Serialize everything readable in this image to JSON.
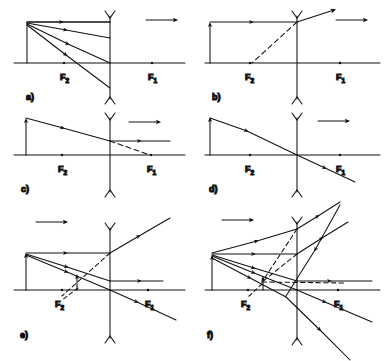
{
  "figure": {
    "background_color": "#ffffff",
    "line_color": "#111111",
    "panel_count": 6,
    "lens_type": "diverging-concave",
    "focal_labels": {
      "left": "F",
      "left_sub": "2",
      "right": "F",
      "right_sub": "1"
    }
  },
  "panels": [
    {
      "id": "a",
      "label": "a)",
      "direction_arrow": "right",
      "description": "Fan of rays from object tip converging toward lens and beyond",
      "has_object_arrow": true,
      "has_dashed_ray": false,
      "ray_count": 4,
      "focal_left": "F",
      "focal_left_sub": "2",
      "focal_right": "F",
      "focal_right_sub": "1"
    },
    {
      "id": "b",
      "label": "b)",
      "direction_arrow": "right",
      "description": "Parallel ray refracted upward, dashed backward extension through F2",
      "has_object_arrow": true,
      "has_dashed_ray": true,
      "ray_count": 2,
      "focal_left": "F",
      "focal_left_sub": "2",
      "focal_right": "F",
      "focal_right_sub": "1"
    },
    {
      "id": "c",
      "label": "c)",
      "direction_arrow": "right",
      "description": "Ray toward F1 emerges parallel to axis, dashed continuation to F1",
      "has_object_arrow": true,
      "has_dashed_ray": true,
      "ray_count": 2,
      "focal_left": "F",
      "focal_left_sub": "2",
      "focal_right": "F",
      "focal_right_sub": "1"
    },
    {
      "id": "d",
      "label": "d)",
      "direction_arrow": "right",
      "description": "Ray through lens centre passes undeviated",
      "has_object_arrow": true,
      "has_dashed_ray": false,
      "ray_count": 1,
      "focal_left": "F",
      "focal_left_sub": "2",
      "focal_right": "F",
      "focal_right_sub": "1"
    },
    {
      "id": "e",
      "label": "e)",
      "direction_arrow": "right",
      "description": "Two principal rays locate reduced virtual image near F2",
      "has_object_arrow": true,
      "has_image_arrow": true,
      "has_dashed_ray": true,
      "ray_count": 3,
      "focal_left": "F",
      "focal_left_sub": "2",
      "focal_right": "F",
      "focal_right_sub": "1"
    },
    {
      "id": "f",
      "label": "f)",
      "direction_arrow": "right",
      "description": "Full ray bundle showing virtual image formation with dashed extensions",
      "has_object_arrow": true,
      "has_image_arrow": true,
      "has_dashed_ray": true,
      "ray_count": 6,
      "focal_left": "F",
      "focal_left_sub": "2",
      "focal_right": "F",
      "focal_right_sub": "1"
    }
  ]
}
